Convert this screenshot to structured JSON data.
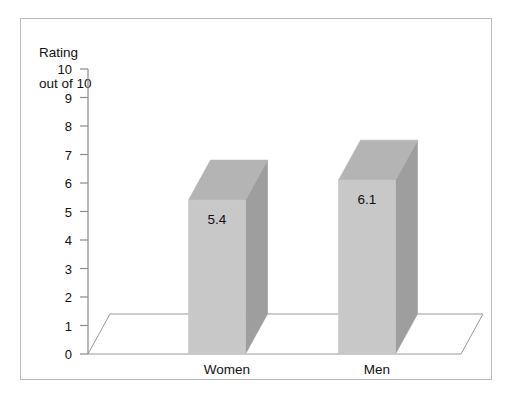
{
  "clipped_caption_text": "",
  "figure": {
    "axis_title_line1": "Rating",
    "axis_title_line2": "out of 10"
  },
  "chart_data": {
    "type": "bar",
    "title": "",
    "subtitle": "",
    "xlabel": "",
    "ylabel": "Rating out of 10",
    "categories": [
      "Women",
      "Men"
    ],
    "values": [
      5.4,
      6.1
    ],
    "value_labels": [
      "5.4",
      "6.1"
    ],
    "ylim": [
      0,
      10
    ],
    "ytick_labels": [
      "0",
      "1",
      "2",
      "3",
      "4",
      "5",
      "6",
      "7",
      "8",
      "9",
      "10"
    ],
    "ytick_values": [
      0,
      1,
      2,
      3,
      4,
      5,
      6,
      7,
      8,
      9,
      10
    ],
    "grid": false,
    "legend": false,
    "legend_position": "none",
    "style": "3d-column",
    "colors": {
      "bar_front": "#c8c8c8",
      "bar_side": "#9e9e9e",
      "bar_top": "#b4b4b4",
      "axis": "#8c8c8c",
      "frame": "#b9b9b9",
      "floor": "#ffffff",
      "text": "#111111"
    },
    "annotations": [
      {
        "text": "5.4",
        "category": "Women"
      },
      {
        "text": "6.1",
        "category": "Men"
      }
    ]
  }
}
